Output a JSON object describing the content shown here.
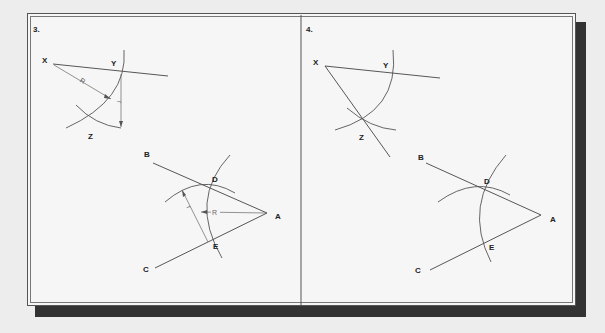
{
  "figure": {
    "panels": [
      {
        "number": "3.",
        "top_construction": {
          "points": {
            "X": "X",
            "Y": "Y",
            "Z": "Z"
          },
          "dimensions": {
            "radius_R": "R",
            "radius_r": "r"
          }
        },
        "bottom_construction": {
          "points": {
            "A": "A",
            "B": "B",
            "C": "C",
            "D": "D",
            "E": "E"
          },
          "dimensions": {
            "radius_R": "R",
            "radius_r": "r"
          }
        }
      },
      {
        "number": "4.",
        "top_construction": {
          "points": {
            "X": "X",
            "Y": "Y",
            "Z": "Z"
          }
        },
        "bottom_construction": {
          "points": {
            "A": "A",
            "B": "B",
            "C": "C",
            "D": "D",
            "E": "E"
          }
        }
      }
    ],
    "colors": {
      "background": "#ededed",
      "panel": "#f6f6f6",
      "line": "#444444",
      "shadow": "#333333"
    }
  }
}
